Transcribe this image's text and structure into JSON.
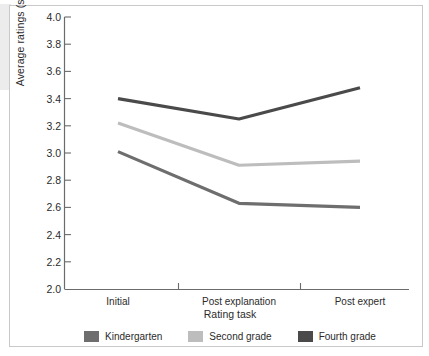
{
  "chart_data": {
    "type": "line",
    "title": "",
    "xlabel": "Rating task",
    "ylabel": "Average ratings (stars)",
    "categories": [
      "Initial",
      "Post explanation",
      "Post expert"
    ],
    "ylim": [
      2.0,
      4.0
    ],
    "ytick_step": 0.2,
    "yticks": [
      "4.0",
      "3.8",
      "3.6",
      "3.4",
      "3.2",
      "3.0",
      "2.8",
      "2.6",
      "2.4",
      "2.2",
      "2.0"
    ],
    "grid": false,
    "legend_position": "bottom",
    "series": [
      {
        "name": "Kindergarten",
        "color": "#6e6e6e",
        "values": [
          3.01,
          2.63,
          2.6
        ]
      },
      {
        "name": "Second grade",
        "color": "#bdbdbd",
        "values": [
          3.22,
          2.91,
          2.94
        ]
      },
      {
        "name": "Fourth grade",
        "color": "#4a4a4a",
        "values": [
          3.4,
          3.25,
          3.48
        ]
      }
    ]
  },
  "axis": {
    "line_color": "#6b6b6b",
    "tick_color": "#6b6b6b"
  },
  "figure": {
    "border_color": "#c9c9c9",
    "background": "#ffffff"
  }
}
